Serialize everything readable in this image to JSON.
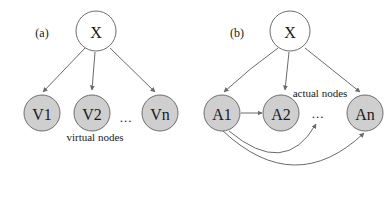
{
  "figure": {
    "background": "#ffffff",
    "node_fill_gray": "#cfcfcf",
    "node_fill_white": "#ffffff",
    "stroke_color": "#6a6a6a",
    "text_color": "#1a1a1a"
  },
  "panels": [
    {
      "id": "a",
      "label": "(a)",
      "root": {
        "name": "root-node-x-a",
        "label": "X"
      },
      "caption": "virtual nodes",
      "ellipsis": "...",
      "nodes": [
        {
          "name": "node-v1",
          "label": "V1"
        },
        {
          "name": "node-v2",
          "label": "V2"
        },
        {
          "name": "node-vn",
          "label": "Vn"
        }
      ],
      "edges": [
        {
          "name": "edge-x-to-v1",
          "from": "X",
          "to": "V1",
          "style": "straight",
          "arrow": true
        },
        {
          "name": "edge-x-to-v2",
          "from": "X",
          "to": "V2",
          "style": "straight",
          "arrow": true
        },
        {
          "name": "edge-x-to-vn",
          "from": "X",
          "to": "Vn",
          "style": "straight",
          "arrow": true
        }
      ]
    },
    {
      "id": "b",
      "label": "(b)",
      "root": {
        "name": "root-node-x-b",
        "label": "X"
      },
      "caption": "actual nodes",
      "ellipsis": "...",
      "nodes": [
        {
          "name": "node-a1",
          "label": "A1"
        },
        {
          "name": "node-a2",
          "label": "A2"
        },
        {
          "name": "node-an",
          "label": "An"
        }
      ],
      "edges": [
        {
          "name": "edge-x-to-a1",
          "from": "X",
          "to": "A1",
          "style": "curved",
          "arrow": true
        },
        {
          "name": "edge-x-to-a2",
          "from": "X",
          "to": "A2",
          "style": "straight",
          "arrow": true
        },
        {
          "name": "edge-x-to-an",
          "from": "X",
          "to": "An",
          "style": "straight",
          "arrow": true
        },
        {
          "name": "edge-a1-to-a2",
          "from": "A1",
          "to": "A2",
          "style": "straight",
          "arrow": true
        },
        {
          "name": "edge-a1-to-ellipsis",
          "from": "A1",
          "to": "...",
          "style": "arc",
          "arrow": true
        },
        {
          "name": "edge-a1-to-an",
          "from": "A1",
          "to": "An",
          "style": "arc",
          "arrow": true
        }
      ]
    }
  ]
}
